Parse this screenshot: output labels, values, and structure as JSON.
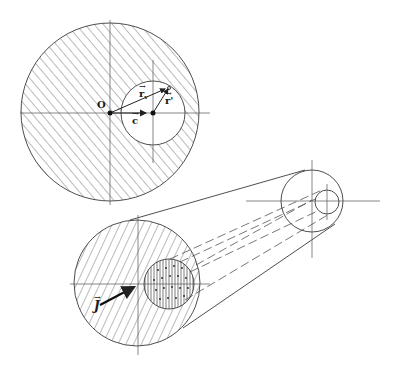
{
  "figure": {
    "type": "geometric-diagram",
    "colors": {
      "line": "#3a3a3a",
      "hatch": "#555555",
      "background": "#ffffff"
    }
  },
  "top_view": {
    "outer_circle": {
      "cx": 110,
      "cy": 112,
      "r": 89
    },
    "inner_circle": {
      "cx": 153,
      "cy": 113,
      "r": 32
    },
    "labels": {
      "origin": "O",
      "c": "c",
      "rv": "r",
      "rv_sub": "v",
      "rprime": "r'"
    }
  },
  "perspective_view": {
    "front_outer": {
      "cx": 137,
      "cy": 283,
      "r": 63
    },
    "front_inner": {
      "cx": 169,
      "cy": 284,
      "r": 25
    },
    "back_outer": {
      "cx": 312,
      "cy": 201,
      "r": 31
    },
    "back_inner": {
      "cx": 327,
      "cy": 202,
      "r": 12
    },
    "labels": {
      "current": "J"
    }
  }
}
